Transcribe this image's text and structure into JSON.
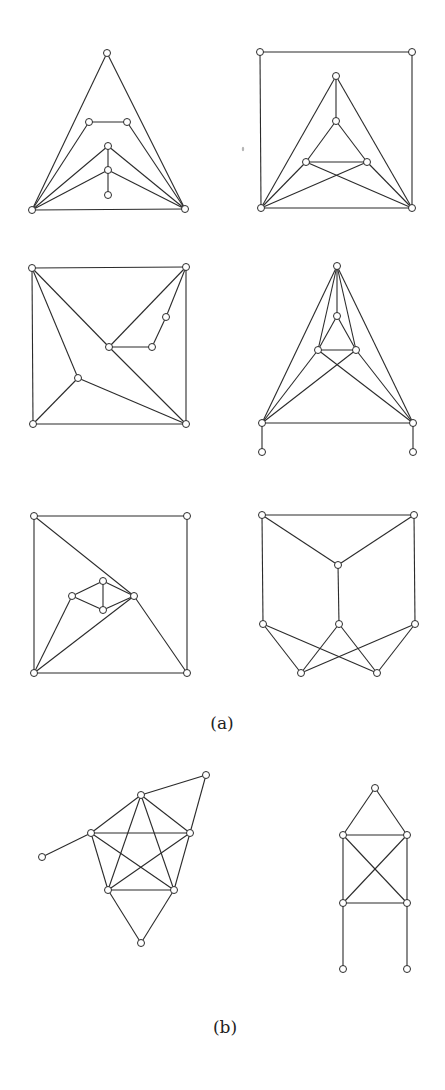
{
  "figure": {
    "parts": [
      {
        "label": "(a)",
        "x": 222,
        "y": 724
      },
      {
        "label": "(b)",
        "x": 225,
        "y": 1028
      }
    ],
    "style": {
      "edge_color": "#2b2b2b",
      "vertex_fill": "#ffffff",
      "vertex_radius": 3.5
    }
  },
  "graphs": [
    {
      "id": "a1",
      "part": "(a)",
      "vertices": [
        [
          107,
          53
        ],
        [
          32,
          210
        ],
        [
          185,
          209
        ],
        [
          89,
          122
        ],
        [
          127,
          122
        ],
        [
          108,
          146
        ],
        [
          108,
          170
        ],
        [
          108,
          195
        ]
      ],
      "edges": [
        [
          0,
          1
        ],
        [
          0,
          2
        ],
        [
          1,
          2
        ],
        [
          1,
          3
        ],
        [
          3,
          4
        ],
        [
          4,
          2
        ],
        [
          1,
          5
        ],
        [
          5,
          2
        ],
        [
          1,
          6
        ],
        [
          6,
          2
        ],
        [
          5,
          6
        ],
        [
          6,
          7
        ]
      ]
    },
    {
      "id": "a2",
      "part": "(a)",
      "vertices": [
        [
          260,
          52
        ],
        [
          412,
          52
        ],
        [
          261,
          208
        ],
        [
          412,
          208
        ],
        [
          336,
          76
        ],
        [
          336,
          121
        ],
        [
          306,
          162
        ],
        [
          367,
          162
        ]
      ],
      "edges": [
        [
          0,
          1
        ],
        [
          0,
          2
        ],
        [
          1,
          3
        ],
        [
          2,
          3
        ],
        [
          4,
          2
        ],
        [
          4,
          3
        ],
        [
          4,
          5
        ],
        [
          5,
          6
        ],
        [
          5,
          7
        ],
        [
          6,
          7
        ],
        [
          6,
          2
        ],
        [
          6,
          3
        ],
        [
          7,
          2
        ],
        [
          7,
          3
        ]
      ]
    },
    {
      "id": "a3",
      "part": "(a)",
      "vertices": [
        [
          32,
          268
        ],
        [
          186,
          267
        ],
        [
          33,
          424
        ],
        [
          186,
          424
        ],
        [
          109,
          347
        ],
        [
          152,
          347
        ],
        [
          166,
          317
        ],
        [
          78,
          378
        ]
      ],
      "edges": [
        [
          0,
          1
        ],
        [
          0,
          2
        ],
        [
          1,
          3
        ],
        [
          2,
          3
        ],
        [
          0,
          4
        ],
        [
          4,
          3
        ],
        [
          1,
          4
        ],
        [
          4,
          5
        ],
        [
          5,
          6
        ],
        [
          6,
          1
        ],
        [
          0,
          7
        ],
        [
          7,
          2
        ],
        [
          7,
          3
        ]
      ]
    },
    {
      "id": "a4",
      "part": "(a)",
      "vertices": [
        [
          337,
          266
        ],
        [
          337,
          316
        ],
        [
          318,
          350
        ],
        [
          356,
          350
        ],
        [
          262,
          423
        ],
        [
          413,
          423
        ],
        [
          262,
          452
        ],
        [
          413,
          452
        ]
      ],
      "edges": [
        [
          0,
          4
        ],
        [
          0,
          5
        ],
        [
          0,
          1
        ],
        [
          0,
          2
        ],
        [
          0,
          3
        ],
        [
          1,
          2
        ],
        [
          1,
          3
        ],
        [
          2,
          3
        ],
        [
          2,
          4
        ],
        [
          2,
          5
        ],
        [
          3,
          4
        ],
        [
          3,
          5
        ],
        [
          4,
          5
        ],
        [
          4,
          6
        ],
        [
          5,
          7
        ]
      ]
    },
    {
      "id": "a5",
      "part": "(a)",
      "vertices": [
        [
          34,
          516
        ],
        [
          187,
          516
        ],
        [
          34,
          673
        ],
        [
          187,
          673
        ],
        [
          134,
          596
        ],
        [
          72,
          596
        ],
        [
          103,
          581
        ],
        [
          103,
          610
        ]
      ],
      "edges": [
        [
          0,
          1
        ],
        [
          0,
          2
        ],
        [
          1,
          3
        ],
        [
          2,
          3
        ],
        [
          0,
          4
        ],
        [
          4,
          3
        ],
        [
          4,
          2
        ],
        [
          5,
          6
        ],
        [
          5,
          7
        ],
        [
          6,
          7
        ],
        [
          6,
          4
        ],
        [
          7,
          4
        ],
        [
          5,
          2
        ]
      ]
    },
    {
      "id": "a6",
      "part": "(a)",
      "vertices": [
        [
          262,
          515
        ],
        [
          414,
          515
        ],
        [
          338,
          565
        ],
        [
          263,
          624
        ],
        [
          339,
          624
        ],
        [
          415,
          624
        ],
        [
          301,
          673
        ],
        [
          377,
          673
        ]
      ],
      "edges": [
        [
          0,
          1
        ],
        [
          0,
          2
        ],
        [
          1,
          2
        ],
        [
          0,
          3
        ],
        [
          1,
          5
        ],
        [
          2,
          4
        ],
        [
          3,
          6
        ],
        [
          3,
          7
        ],
        [
          4,
          6
        ],
        [
          4,
          7
        ],
        [
          5,
          6
        ],
        [
          5,
          7
        ]
      ]
    },
    {
      "id": "b1",
      "part": "(b)",
      "vertices": [
        [
          141,
          795
        ],
        [
          206,
          775
        ],
        [
          91,
          833
        ],
        [
          190,
          833
        ],
        [
          108,
          890
        ],
        [
          174,
          890
        ],
        [
          42,
          857
        ],
        [
          141,
          943
        ]
      ],
      "edges": [
        [
          0,
          2
        ],
        [
          0,
          3
        ],
        [
          0,
          4
        ],
        [
          0,
          5
        ],
        [
          2,
          3
        ],
        [
          2,
          4
        ],
        [
          2,
          5
        ],
        [
          3,
          4
        ],
        [
          3,
          5
        ],
        [
          4,
          5
        ],
        [
          0,
          1
        ],
        [
          1,
          3
        ],
        [
          2,
          6
        ],
        [
          4,
          7
        ],
        [
          5,
          7
        ]
      ]
    },
    {
      "id": "b2",
      "part": "(b)",
      "vertices": [
        [
          375,
          788
        ],
        [
          343,
          835
        ],
        [
          407,
          835
        ],
        [
          343,
          903
        ],
        [
          407,
          903
        ],
        [
          343,
          969
        ],
        [
          407,
          969
        ]
      ],
      "edges": [
        [
          0,
          1
        ],
        [
          0,
          2
        ],
        [
          1,
          2
        ],
        [
          1,
          3
        ],
        [
          1,
          4
        ],
        [
          2,
          3
        ],
        [
          2,
          4
        ],
        [
          3,
          4
        ],
        [
          3,
          5
        ],
        [
          4,
          6
        ]
      ]
    }
  ]
}
